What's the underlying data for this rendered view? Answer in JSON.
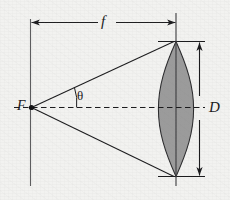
{
  "figure": {
    "type": "optics-ray-diagram",
    "labels": {
      "focal_length": "f",
      "focal_point": "F",
      "aperture_diameter": "D",
      "half_angle": "θ"
    },
    "colors": {
      "background": "#f2f2f0",
      "ink": "#1a1a1c",
      "lens_fill": "#9b9b9b",
      "lens_stroke": "#2a2a2c"
    },
    "elements": [
      {
        "name": "focal-plane-line",
        "kind": "vertical-line",
        "note": "vertical line through focal point F"
      },
      {
        "name": "optical-axis",
        "kind": "dashed-horizontal",
        "note": "dashed axis from F through lens center"
      },
      {
        "name": "focal-length-dimension",
        "kind": "double-arrow",
        "note": "horizontal arrow labelled f"
      },
      {
        "name": "aperture-dimension",
        "kind": "double-arrow",
        "note": "vertical arrow labelled D"
      },
      {
        "name": "upper-marginal-ray",
        "kind": "line",
        "note": "ray from F to top lens rim"
      },
      {
        "name": "lower-marginal-ray",
        "kind": "line",
        "note": "ray from F to bottom lens rim"
      },
      {
        "name": "half-angle-arc",
        "kind": "arc",
        "note": "arc marking angle theta"
      },
      {
        "name": "biconvex-lens",
        "kind": "filled-shape",
        "note": "shaded biconvex lens"
      },
      {
        "name": "lens-axis-line",
        "kind": "vertical-line",
        "note": "lens principal plane line"
      }
    ]
  }
}
